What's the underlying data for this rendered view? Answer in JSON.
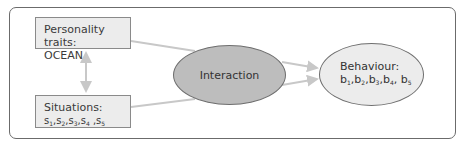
{
  "diagram": {
    "nodes": {
      "personality": {
        "title": "Personality traits:",
        "subtitle": "OCEAN"
      },
      "situations": {
        "title": "Situations:",
        "items": [
          {
            "base": "s",
            "sub": "1",
            "sep": ","
          },
          {
            "base": "s",
            "sub": "2",
            "sep": ","
          },
          {
            "base": "s",
            "sub": "3",
            "sep": ","
          },
          {
            "base": "s",
            "sub": "4",
            "sep": " ,"
          },
          {
            "base": "s",
            "sub": "5",
            "sep": ""
          }
        ]
      },
      "interaction": {
        "label": "Interaction"
      },
      "behaviour": {
        "title": "Behaviour:",
        "items": [
          {
            "base": "b",
            "sub": "1",
            "sep": ","
          },
          {
            "base": "b",
            "sub": "2",
            "sep": ","
          },
          {
            "base": "b",
            "sub": "3",
            "sep": ","
          },
          {
            "base": "b",
            "sub": "4",
            "sep": ", "
          },
          {
            "base": "b",
            "sub": "5",
            "sep": ""
          }
        ]
      }
    },
    "edges": [
      {
        "from": "personality",
        "to": "situations",
        "type": "bidirectional"
      },
      {
        "from": "personality",
        "to": "interaction",
        "type": "line"
      },
      {
        "from": "situations",
        "to": "interaction",
        "type": "line"
      },
      {
        "from": "interaction",
        "to": "behaviour",
        "type": "arrow"
      },
      {
        "from": "interaction",
        "to": "behaviour",
        "type": "arrow"
      }
    ],
    "colors": {
      "box_fill": "#ececec",
      "interaction_fill": "#bdbdbd",
      "behaviour_fill": "#ececec",
      "connector": "#c8c8c8",
      "border": "#7a7a7a"
    }
  }
}
